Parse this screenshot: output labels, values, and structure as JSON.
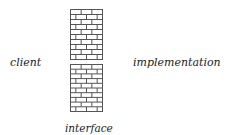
{
  "labels": {
    "client": "client",
    "implementation": "implementation",
    "interface": "interface"
  },
  "walls": [
    {
      "name": "top",
      "x": 70,
      "y": 9,
      "width": 32,
      "height": 50,
      "rows": 10
    },
    {
      "name": "bottom",
      "x": 70,
      "y": 64,
      "width": 32,
      "height": 47,
      "rows": 10
    }
  ],
  "colors": {
    "line": "#555555",
    "text": "#222222"
  }
}
